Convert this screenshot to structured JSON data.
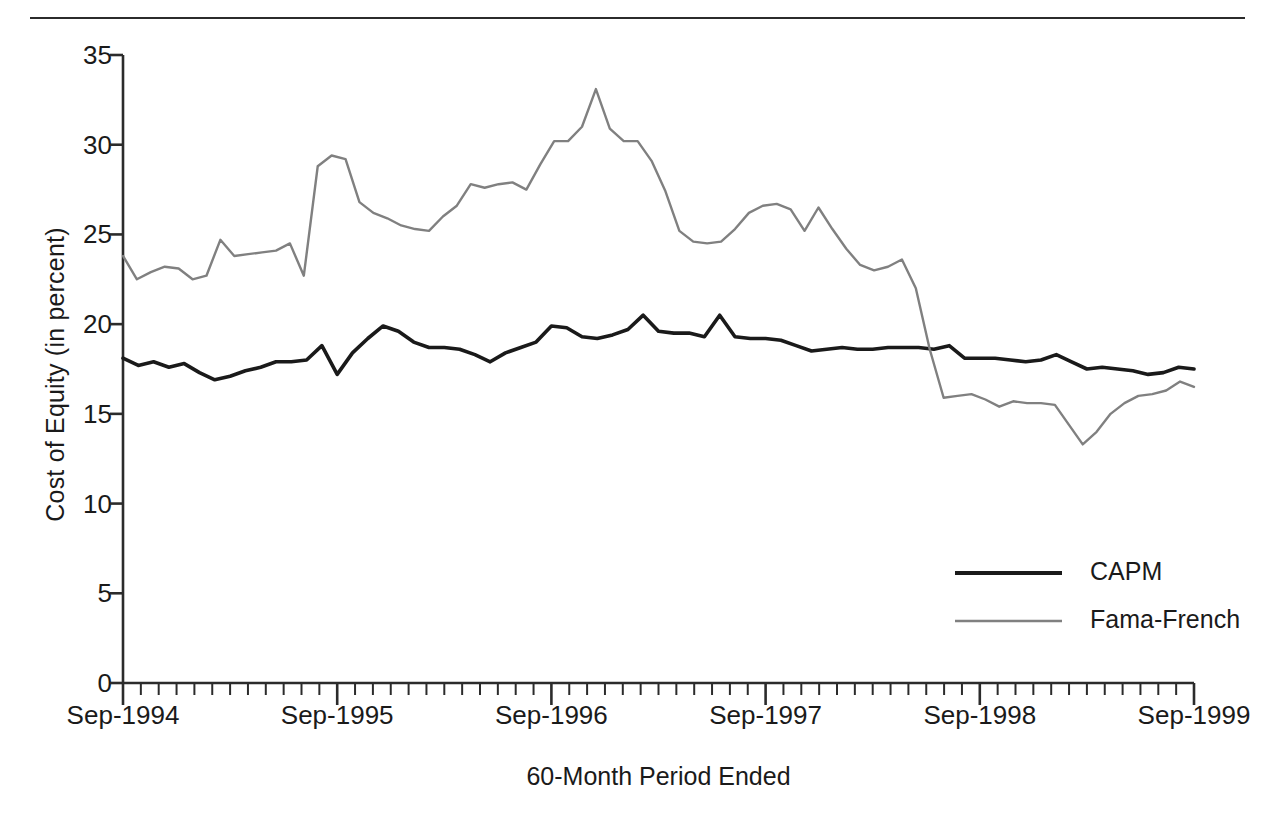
{
  "chart_data": {
    "type": "line",
    "title": "",
    "xlabel": "60-Month Period Ended",
    "ylabel": "Cost of Equity (in percent)",
    "ylim": [
      0,
      35
    ],
    "yticks": [
      0,
      5,
      10,
      15,
      20,
      25,
      30,
      35
    ],
    "ytick_labels": [
      "0",
      "5",
      "10",
      "15",
      "20",
      "25",
      "30",
      "35"
    ],
    "xtick_labels": [
      "Sep-1994",
      "Sep-1995",
      "Sep-1996",
      "Sep-1997",
      "Sep-1998",
      "Sep-1999"
    ],
    "xtick_values": [
      0,
      12,
      24,
      36,
      48,
      60
    ],
    "x_minor_tick_interval_months": 1,
    "x_range_months": [
      0,
      60
    ],
    "grid": false,
    "legend_position": "lower right",
    "colors": {
      "capm": "#1a1a1a",
      "fama_french": "#808080",
      "axis": "#2b2b2b",
      "background": "#ffffff"
    },
    "series": [
      {
        "name": "CAPM",
        "color": "#1a1a1a",
        "values": [
          18.1,
          17.7,
          17.9,
          17.6,
          17.8,
          17.3,
          16.9,
          17.1,
          17.4,
          17.6,
          17.9,
          17.9,
          18.0,
          18.8,
          17.2,
          18.4,
          19.2,
          19.9,
          19.6,
          19.0,
          18.7,
          18.7,
          18.6,
          18.3,
          17.9,
          18.4,
          18.7,
          19.0,
          19.9,
          19.8,
          19.3,
          19.2,
          19.4,
          19.7,
          20.5,
          19.6,
          19.5,
          19.5,
          19.3,
          20.5,
          19.3,
          19.2,
          19.2,
          19.1,
          18.8,
          18.5,
          18.6,
          18.7,
          18.6,
          18.6,
          18.7,
          18.7,
          18.7,
          18.6,
          18.8,
          18.1,
          18.1,
          18.1,
          18.0,
          17.9,
          18.0,
          18.3,
          17.9,
          17.5,
          17.6,
          17.5,
          17.4,
          17.2,
          17.3,
          17.6,
          17.5
        ]
      },
      {
        "name": "Fama-French",
        "color": "#808080",
        "values": [
          23.8,
          22.5,
          22.9,
          23.2,
          23.1,
          22.5,
          22.7,
          24.7,
          23.8,
          23.9,
          24.0,
          24.1,
          24.5,
          22.7,
          28.8,
          29.4,
          29.2,
          26.8,
          26.2,
          25.9,
          25.5,
          25.3,
          25.2,
          26.0,
          26.6,
          27.8,
          27.6,
          27.8,
          27.9,
          27.5,
          28.9,
          30.2,
          30.2,
          31.0,
          33.1,
          30.9,
          30.2,
          30.2,
          29.1,
          27.4,
          25.2,
          24.6,
          24.5,
          24.6,
          25.3,
          26.2,
          26.6,
          26.7,
          26.4,
          25.2,
          26.5,
          25.3,
          24.2,
          23.3,
          23.0,
          23.2,
          23.6,
          22.0,
          18.6,
          15.9,
          16.0,
          16.1,
          15.8,
          15.4,
          15.7,
          15.6,
          15.6,
          15.5,
          14.4,
          13.3,
          14.0,
          15.0,
          15.6,
          16.0,
          16.1,
          16.3,
          16.8,
          16.5
        ]
      }
    ]
  },
  "legend": {
    "items": [
      {
        "label": "CAPM",
        "color": "#1a1a1a"
      },
      {
        "label": "Fama-French",
        "color": "#808080"
      }
    ]
  },
  "axes": {
    "y_title": "Cost of Equity (in percent)",
    "x_title": "60-Month Period Ended"
  }
}
